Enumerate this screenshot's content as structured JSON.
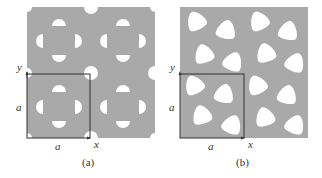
{
  "figure": {
    "panels": [
      {
        "id": "a",
        "caption": "(a)",
        "axis_y_label": "y",
        "axis_x_label": "x",
        "side_label": "a",
        "bottom_label": "a",
        "description": "square lattice of semicircular holes (4-fold)"
      },
      {
        "id": "b",
        "caption": "(b)",
        "axis_y_label": "y",
        "axis_x_label": "x",
        "side_label": "a",
        "bottom_label": "a",
        "description": "lattice of rounded triangular holes"
      }
    ],
    "colors": {
      "material": "#a9a9a9",
      "hole": "#ffffff",
      "frame": "#333333"
    }
  }
}
